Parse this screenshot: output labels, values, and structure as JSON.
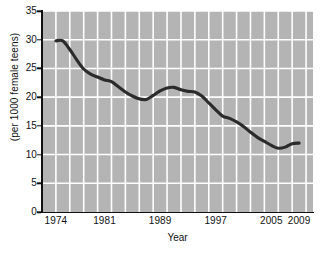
{
  "chart_data": {
    "type": "line",
    "title": "",
    "xlabel": "Year",
    "ylabel": "(per 1000 female teens)",
    "xlim": [
      1972,
      2011
    ],
    "ylim": [
      0,
      35
    ],
    "grid": true,
    "legend": "none",
    "line_color": "#2b2b2b",
    "plot_background": "#b4b4b4",
    "gridline_color": "#ffffff",
    "x_tick_labels": [
      "1974",
      "1981",
      "1989",
      "1997",
      "2005",
      "2009"
    ],
    "x_tick_values": [
      1974,
      1981,
      1989,
      1997,
      2005,
      2009
    ],
    "y_tick_labels": [
      "0",
      "5",
      "10",
      "15",
      "20",
      "25",
      "30",
      "35"
    ],
    "y_tick_values": [
      0,
      5,
      10,
      15,
      20,
      25,
      30,
      35
    ],
    "x": [
      1974,
      1975,
      1976,
      1977,
      1978,
      1979,
      1980,
      1981,
      1982,
      1983,
      1984,
      1985,
      1986,
      1987,
      1988,
      1989,
      1990,
      1991,
      1992,
      1993,
      1994,
      1995,
      1996,
      1997,
      1998,
      1999,
      2000,
      2001,
      2002,
      2003,
      2004,
      2005,
      2006,
      2007,
      2008,
      2009
    ],
    "values": [
      29.8,
      29.8,
      28.3,
      26.5,
      24.9,
      24.0,
      23.5,
      23.0,
      22.7,
      21.8,
      20.9,
      20.2,
      19.7,
      19.6,
      20.3,
      21.1,
      21.6,
      21.7,
      21.3,
      21.0,
      20.9,
      20.2,
      19.0,
      17.8,
      16.7,
      16.3,
      15.7,
      14.9,
      13.9,
      13.0,
      12.3,
      11.6,
      11.1,
      11.3,
      11.9,
      12.0
    ],
    "series_name": "Teen birth rate",
    "annotations": []
  },
  "axes": {
    "x_title": "Year",
    "y_title": "(per 1000 female teens)"
  }
}
